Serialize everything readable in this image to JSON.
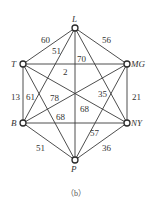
{
  "caption": "（b）",
  "nodes": [
    {
      "id": "L",
      "label": "L",
      "x": 75,
      "y": 28,
      "lx": 72,
      "ly": 22
    },
    {
      "id": "T",
      "label": "T",
      "x": 23,
      "y": 64,
      "lx": 11,
      "ly": 67
    },
    {
      "id": "MG",
      "label": "MG",
      "x": 127,
      "y": 64,
      "lx": 131,
      "ly": 67
    },
    {
      "id": "B",
      "label": "B",
      "x": 23,
      "y": 123,
      "lx": 11,
      "ly": 126
    },
    {
      "id": "NY",
      "label": "NY",
      "x": 127,
      "y": 123,
      "lx": 131,
      "ly": 126
    },
    {
      "id": "P",
      "label": "P",
      "x": 75,
      "y": 160,
      "lx": 71,
      "ly": 172
    }
  ],
  "edges": [
    {
      "from": "L",
      "to": "T",
      "weight": "60"
    },
    {
      "from": "L",
      "to": "MG",
      "weight": "56"
    },
    {
      "from": "L",
      "to": "B",
      "weight": "51"
    },
    {
      "from": "L",
      "to": "P",
      "weight": "70"
    },
    {
      "from": "L",
      "to": "NY",
      "weight": ""
    },
    {
      "from": "T",
      "to": "MG",
      "weight": "2"
    },
    {
      "from": "T",
      "to": "B",
      "weight": "13"
    },
    {
      "from": "T",
      "to": "P",
      "weight": "61"
    },
    {
      "from": "T",
      "to": "NY",
      "weight": "68"
    },
    {
      "from": "MG",
      "to": "B",
      "weight": "78"
    },
    {
      "from": "MG",
      "to": "NY",
      "weight": "21"
    },
    {
      "from": "MG",
      "to": "P",
      "weight": "35"
    },
    {
      "from": "B",
      "to": "NY",
      "weight": "68"
    },
    {
      "from": "B",
      "to": "P",
      "weight": "51"
    },
    {
      "from": "NY",
      "to": "P",
      "weight": "36"
    }
  ],
  "weight_labels": [
    {
      "text": "60",
      "x": 41,
      "y": 43
    },
    {
      "text": "51",
      "x": 52,
      "y": 54
    },
    {
      "text": "56",
      "x": 102,
      "y": 43
    },
    {
      "text": "70",
      "x": 77,
      "y": 62
    },
    {
      "text": "2",
      "x": 63,
      "y": 75
    },
    {
      "text": "13",
      "x": 11,
      "y": 100
    },
    {
      "text": "61",
      "x": 26,
      "y": 100
    },
    {
      "text": "78",
      "x": 50,
      "y": 101
    },
    {
      "text": "35",
      "x": 98,
      "y": 97
    },
    {
      "text": "21",
      "x": 132,
      "y": 100
    },
    {
      "text": "68",
      "x": 80,
      "y": 112
    },
    {
      "text": "68",
      "x": 56,
      "y": 120
    },
    {
      "text": "57",
      "x": 90,
      "y": 136
    },
    {
      "text": "51",
      "x": 36,
      "y": 151
    },
    {
      "text": "36",
      "x": 102,
      "y": 151
    }
  ]
}
